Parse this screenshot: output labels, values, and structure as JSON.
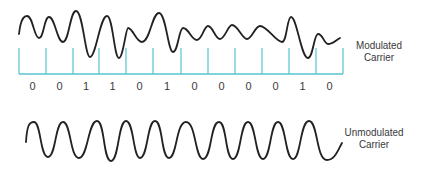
{
  "diagram": {
    "colors": {
      "wave": "#222222",
      "tick": "#56C3D2",
      "text": "#3a3a3a"
    },
    "modulated": {
      "label_line1": "Modulated",
      "label_line2": "Carrier",
      "path": "M19,34 C21,16 25,16 27,16 C33,16 34,38 39,38 C44,38 44,17 49,17 C55,17 57,42 63,42 C69,42 70,11 76,11 C83,11 85,57 90,57 C96,57 100,16 107,16 C113,16 114,58 119,58 C123,58 126,28 128,28 C133,28 136,42 142,42 C150,42 152,13 159,13 C166,13 168,52 173,52 C178,52 179,28 183,28 C189,28 191,40 197,40 C202,40 204,26 208,26 C213,26 215,39 220,39 C225,39 228,25 232,25 C238,25 242,39 247,39 C252,39 255,26 260,26 C267,26 276,42 282,42 C287,42 287,17 291,17 C297,17 301,58 308,58 C313,58 314,34 318,34 C323,34 324,44 328,44 C333,44 336,40 340,38",
      "baseline": {
        "x1": 19,
        "x2": 343,
        "y": 74
      },
      "tick_top": 48,
      "ticks_x": [
        19,
        46,
        73,
        99,
        126,
        153,
        181,
        208,
        235,
        262,
        289,
        316,
        343
      ],
      "bits": [
        "0",
        "0",
        "1",
        "1",
        "0",
        "1",
        "0",
        "0",
        "0",
        "0",
        "1",
        "0"
      ]
    },
    "unmodulated": {
      "label_line1": "Unmodulated",
      "label_line2": "Carrier",
      "path": "M26,142 C27,126 29,122 34,122 C41,122 40,157 48,157 C56,157 55,122 63,122 C71,122 70,158 79,158 C88,158 88,121 97,121 C105,121 103,161 111,161 C119,161 118,121 126,121 C134,121 133,158 140,158 C148,158 147,121 155,121 C163,121 161,158 169,158 C177,158 176,122 186,122 C196,122 195,159 203,159 C212,159 210,122 219,122 C227,122 225,159 233,159 C241,159 240,122 248,122 C256,122 255,159 263,159 C271,159 270,122 278,122 C286,122 285,159 293,159 C301,159 300,121 309,121 C318,121 316,160 327,160 C335,160 338,150 342,143"
    }
  }
}
